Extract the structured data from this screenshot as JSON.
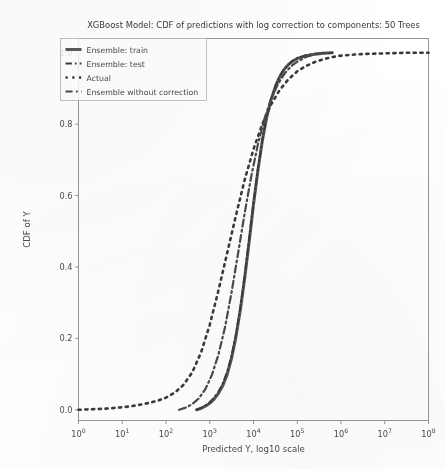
{
  "chart_data": {
    "type": "line",
    "title": "XGBoost Model: CDF of predictions with log correction to components: 50 Trees",
    "xlabel": "Predicted Y, log10 scale",
    "ylabel": "CDF of Y",
    "grid": false,
    "legend_position": "upper left",
    "x_scale": "log10",
    "xlim": [
      1,
      100000000
    ],
    "ylim": [
      -0.03,
      1.04
    ],
    "x_ticks": [
      1,
      10,
      100,
      1000,
      10000,
      100000,
      1000000,
      10000000,
      100000000
    ],
    "x_tick_labels": [
      "10^0",
      "10^1",
      "10^2",
      "10^3",
      "10^4",
      "10^5",
      "10^6",
      "10^7",
      "10^8"
    ],
    "y_ticks": [
      0.0,
      0.2,
      0.4,
      0.6,
      0.8,
      1.0
    ],
    "y_tick_labels": [
      "0.0",
      "0.2",
      "0.4",
      "0.6",
      "0.8",
      "1.0"
    ],
    "series": [
      {
        "name": "Ensemble: train",
        "style": "solid",
        "color": "#5a5a5a",
        "width": 3.0,
        "x_log10": [
          2.7,
          2.8,
          2.9,
          3.0,
          3.1,
          3.2,
          3.3,
          3.4,
          3.5,
          3.6,
          3.7,
          3.8,
          3.9,
          4.0,
          4.1,
          4.2,
          4.3,
          4.4,
          4.5,
          4.6,
          4.7,
          4.8,
          4.9,
          5.0,
          5.2,
          5.4,
          5.6,
          5.8
        ],
        "values": [
          0.0,
          0.004,
          0.01,
          0.018,
          0.03,
          0.046,
          0.068,
          0.1,
          0.145,
          0.205,
          0.28,
          0.37,
          0.47,
          0.575,
          0.67,
          0.752,
          0.818,
          0.868,
          0.905,
          0.933,
          0.953,
          0.967,
          0.977,
          0.984,
          0.992,
          0.996,
          0.999,
          1.0
        ]
      },
      {
        "name": "Ensemble: test",
        "style": "dashdot",
        "color": "#3c3c3c",
        "width": 2.0,
        "x_log10": [
          2.7,
          2.8,
          2.9,
          3.0,
          3.1,
          3.2,
          3.3,
          3.4,
          3.5,
          3.6,
          3.7,
          3.8,
          3.9,
          4.0,
          4.1,
          4.2,
          4.3,
          4.4,
          4.5,
          4.6,
          4.7,
          4.8,
          4.9,
          5.0,
          5.2,
          5.4,
          5.6,
          5.8
        ],
        "values": [
          0.0,
          0.005,
          0.012,
          0.021,
          0.034,
          0.051,
          0.074,
          0.107,
          0.152,
          0.212,
          0.288,
          0.378,
          0.478,
          0.58,
          0.674,
          0.755,
          0.821,
          0.87,
          0.907,
          0.935,
          0.954,
          0.968,
          0.978,
          0.985,
          0.993,
          0.997,
          0.999,
          1.0
        ]
      },
      {
        "name": "Actual",
        "style": "dotted",
        "color": "#3a3a3a",
        "width": 2.6,
        "x_log10": [
          0.0,
          0.2,
          0.4,
          0.6,
          0.8,
          1.0,
          1.2,
          1.4,
          1.6,
          1.8,
          2.0,
          2.2,
          2.4,
          2.6,
          2.8,
          3.0,
          3.2,
          3.4,
          3.6,
          3.8,
          4.0,
          4.2,
          4.4,
          4.6,
          4.8,
          5.0,
          5.2,
          5.4,
          5.6,
          5.8,
          6.0,
          6.3,
          6.6,
          6.9,
          7.2,
          7.5,
          7.8,
          8.0
        ],
        "values": [
          0.0,
          0.001,
          0.002,
          0.003,
          0.005,
          0.007,
          0.01,
          0.014,
          0.019,
          0.025,
          0.034,
          0.048,
          0.07,
          0.105,
          0.16,
          0.238,
          0.335,
          0.44,
          0.545,
          0.645,
          0.73,
          0.8,
          0.855,
          0.896,
          0.926,
          0.948,
          0.963,
          0.974,
          0.982,
          0.988,
          0.992,
          0.995,
          0.997,
          0.998,
          0.999,
          1.0,
          1.0,
          1.0
        ]
      },
      {
        "name": "Ensemble without correction",
        "style": "dashdot",
        "color": "#4a4a4a",
        "width": 2.2,
        "x_log10": [
          2.3,
          2.45,
          2.6,
          2.75,
          2.9,
          3.05,
          3.2,
          3.35,
          3.5,
          3.65,
          3.8,
          3.95,
          4.1,
          4.25,
          4.4,
          4.55,
          4.7,
          4.85,
          5.0,
          5.2,
          5.4,
          5.6
        ],
        "values": [
          0.0,
          0.006,
          0.016,
          0.032,
          0.058,
          0.098,
          0.155,
          0.232,
          0.33,
          0.44,
          0.552,
          0.655,
          0.743,
          0.815,
          0.87,
          0.91,
          0.94,
          0.961,
          0.975,
          0.988,
          0.996,
          1.0
        ]
      }
    ]
  },
  "legend": {
    "entries": [
      {
        "label": "Ensemble: train",
        "style": "solid"
      },
      {
        "label": "Ensemble: test",
        "style": "dashdot"
      },
      {
        "label": "Actual",
        "style": "dotted"
      },
      {
        "label": "Ensemble without correction",
        "style": "dashdot"
      }
    ]
  },
  "colors": {
    "axis": "#8c8c8c",
    "text": "#4a4a4a",
    "background": "#ffffff"
  }
}
